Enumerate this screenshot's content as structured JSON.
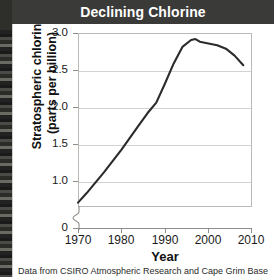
{
  "figure": {
    "title": "Declining Chlorine",
    "caption": "Data from CSIRO Atmospheric Research and Cape Grim Baseline Air",
    "title_band_color": "#3a3a38",
    "title_text_color": "#ffffff",
    "line_color": "#2b2b2b",
    "grid_color": "#d3d3cf",
    "frame_color": "#b9b9b5"
  },
  "chart_data": {
    "type": "line",
    "title": "Declining Chlorine",
    "xlabel": "Year",
    "ylabel": "Stratospheric chlorine (parts per billion)",
    "ylabel_line1": "Stratospheric chlorine",
    "ylabel_line2": "(parts per billion)",
    "xlim": [
      1970,
      2010
    ],
    "ylim": [
      1.0,
      3.0
    ],
    "y_axis_break": true,
    "y_break_label": "0",
    "grid": true,
    "legend": "none",
    "xticks": [
      1970,
      1980,
      1990,
      2000,
      2010
    ],
    "xticklabels": [
      "1970",
      "1980",
      "1990",
      "2000",
      "2010"
    ],
    "yticks": [
      1.0,
      1.5,
      2.0,
      2.5,
      3.0
    ],
    "yticklabels": [
      "1.0",
      "1.5",
      "2.0",
      "2.5",
      "3.0"
    ],
    "series": [
      {
        "name": "Stratospheric chlorine",
        "x": [
          1970,
          1972,
          1974,
          1976,
          1978,
          1980,
          1982,
          1984,
          1986,
          1988,
          1990,
          1992,
          1994,
          1996,
          1997,
          1998,
          2000,
          2002,
          2004,
          2006,
          2008
        ],
        "values": [
          1.05,
          1.16,
          1.28,
          1.4,
          1.53,
          1.66,
          1.8,
          1.94,
          2.08,
          2.2,
          2.42,
          2.65,
          2.84,
          2.92,
          2.93,
          2.9,
          2.88,
          2.86,
          2.82,
          2.74,
          2.63
        ]
      }
    ]
  },
  "axis": {
    "x_title": "Year",
    "y_title_line1": "Stratospheric chlorine",
    "y_title_line2": "(parts per billion)"
  }
}
